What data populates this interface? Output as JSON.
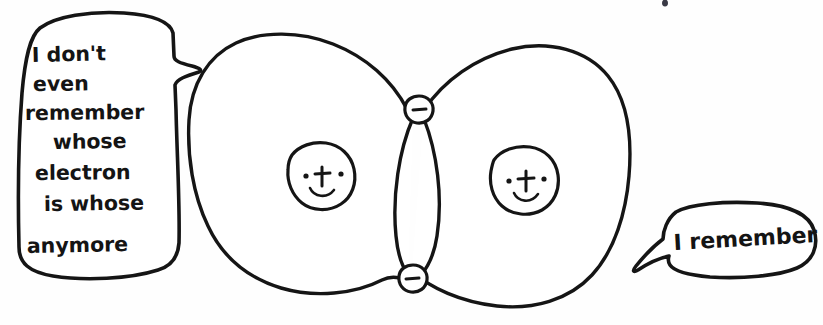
{
  "scene": {
    "title": "Covalent bond cartoon",
    "description": "Two hand-drawn atoms with overlapping electron shells sharing two electrons, each atom speaking",
    "canvas": {
      "width": 823,
      "height": 325
    },
    "style": "hand-drawn black ink on white paper"
  },
  "colors": {
    "ink": "#151515",
    "paper": "#fefefe",
    "nucleus_fill_left": "#d8d8d8",
    "nucleus_fill_right": "#c9c9c9",
    "shell_fill": "#ffffff",
    "speck": "#3a3a46"
  },
  "speech_bubbles": [
    {
      "id": "left-bubble",
      "speaker": "left-atom",
      "tail_direction": "right",
      "lines": [
        "I don't",
        "even",
        "remember",
        "whose",
        "electron",
        "is whose",
        "anymore"
      ],
      "full_text": "I don't even remember whose electron is whose anymore"
    },
    {
      "id": "right-bubble",
      "speaker": "right-atom",
      "tail_direction": "down-left",
      "lines": [
        "I remember"
      ],
      "full_text": "I remember"
    }
  ],
  "atoms": [
    {
      "id": "left-atom",
      "label": "left electron shell",
      "nucleus": {
        "label": "left nucleus",
        "charge_symbol": "+",
        "expression": "smiling",
        "eyes": 2,
        "fill": "#d8d8d8"
      }
    },
    {
      "id": "right-atom",
      "label": "right electron shell",
      "nucleus": {
        "label": "right nucleus",
        "charge_symbol": "+",
        "expression": "smiling",
        "eyes": 2,
        "fill": "#c9c9c9"
      }
    }
  ],
  "electrons": [
    {
      "id": "electron-top",
      "charge_symbol": "−",
      "position": "top intersection of the two shells",
      "shared_by": [
        "left-atom",
        "right-atom"
      ]
    },
    {
      "id": "electron-bottom",
      "charge_symbol": "−",
      "position": "bottom intersection of the two shells",
      "shared_by": [
        "left-atom",
        "right-atom"
      ]
    }
  ],
  "marks": [
    {
      "id": "ink-speck",
      "label": "stray ink speck"
    }
  ]
}
